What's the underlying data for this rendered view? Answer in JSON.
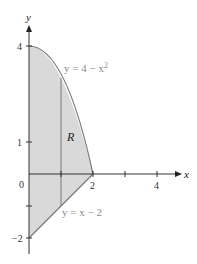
{
  "figure": {
    "axes": {
      "x_label": "x",
      "y_label": "y",
      "x_ticks": [
        {
          "value": 0,
          "label": "0"
        },
        {
          "value": 1,
          "label": ""
        },
        {
          "value": 2,
          "label": "2"
        },
        {
          "value": 3,
          "label": ""
        },
        {
          "value": 4,
          "label": "4"
        }
      ],
      "y_ticks": [
        {
          "value": 4,
          "label": "4"
        },
        {
          "value": 1,
          "label": "1"
        },
        {
          "value": -1,
          "label": ""
        },
        {
          "value": -2,
          "label": "−2"
        }
      ]
    },
    "curves": {
      "upper": {
        "label": "y = 4 − x²",
        "equation": "y = 4 - x^2",
        "exponent": "2",
        "prefix": "y = 4 − x"
      },
      "lower": {
        "label": "y = x − 2",
        "equation": "y = x - 2"
      }
    },
    "region": {
      "label": "R",
      "fill": "#d9d9d9"
    },
    "vertical_strip_x": 1,
    "colors": {
      "axis": "#333333",
      "curve": "#7a7a7a",
      "region_fill": "#d9d9d9",
      "label_gray": "#8a8a8a"
    }
  }
}
